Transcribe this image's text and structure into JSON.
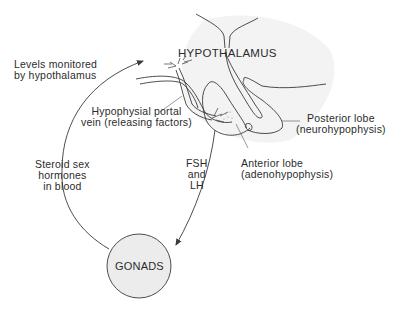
{
  "diagram": {
    "title_label": "HYPOTHALAMUS",
    "labels": {
      "levels_monitored": [
        "Levels monitored",
        "by hypothalamus"
      ],
      "portal_vein": [
        "Hypophysial portal",
        "vein (releasing factors)"
      ],
      "posterior_lobe": [
        "Posterior lobe",
        "(neurohypophysis)"
      ],
      "anterior_lobe": [
        "Anterior lobe",
        "(adenohypophysis)"
      ],
      "fsh_lh": [
        "FSH",
        "and",
        "LH"
      ],
      "steroid": [
        "Steroid sex",
        "hormones",
        "in blood"
      ],
      "gonads": "GONADS"
    },
    "colors": {
      "line": "#3a3a3a",
      "gonads_fill": "#ececec",
      "shading": "#f1f1f1"
    }
  }
}
